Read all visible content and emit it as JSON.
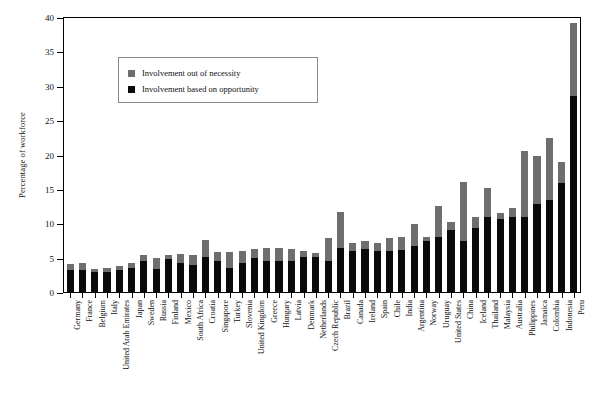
{
  "chart_data": {
    "type": "bar",
    "stacked": true,
    "title": "",
    "xlabel": "",
    "ylabel": "Percentage of workforce",
    "ylim": [
      0,
      40
    ],
    "yticks": [
      0,
      5,
      10,
      15,
      20,
      25,
      30,
      35,
      40
    ],
    "grid": false,
    "legend_position": "upper-left-inside",
    "colors": {
      "necessity": "#6e6e6e",
      "opportunity": "#0a0a0a"
    },
    "categories": [
      "Germany",
      "France",
      "Belgium",
      "Italy",
      "United Arab Emirates",
      "Japan",
      "Sweden",
      "Russia",
      "Finland",
      "Mexico",
      "South Africa",
      "Croatia",
      "Singapore",
      "Turkey",
      "Slovenia",
      "United Kingdom",
      "Greece",
      "Hungary",
      "Latvia",
      "Denmark",
      "Netherlands",
      "Czech Republic",
      "Brazil",
      "Canada",
      "Ireland",
      "Spain",
      "Chile",
      "India",
      "Argentina",
      "Norway",
      "Uruguay",
      "United States",
      "China",
      "Iceland",
      "Thailand",
      "Malaysia",
      "Australia",
      "Philippines",
      "Jamaica",
      "Colombia",
      "Indonesia",
      "Peru"
    ],
    "series": [
      {
        "name": "Involvement based on opportunity",
        "key": "opportunity",
        "values": [
          3.3,
          3.4,
          3.0,
          3.1,
          3.3,
          3.6,
          4.6,
          3.5,
          4.9,
          4.4,
          4.1,
          5.3,
          4.6,
          3.7,
          4.3,
          5.1,
          4.7,
          4.6,
          4.6,
          5.3,
          5.2,
          4.6,
          6.5,
          6.1,
          6.4,
          6.1,
          6.1,
          6.2,
          6.9,
          7.5,
          8.2,
          9.2,
          7.6,
          9.5,
          11.0,
          10.8,
          11.1,
          11.0,
          13.0,
          13.5,
          16.0,
          28.7
        ]
      },
      {
        "name": "Involvement out of necessity",
        "key": "necessity",
        "values": [
          0.9,
          0.9,
          0.5,
          0.5,
          0.6,
          0.7,
          0.9,
          1.6,
          0.6,
          1.3,
          1.5,
          2.4,
          1.4,
          2.3,
          1.8,
          1.3,
          1.9,
          2.0,
          1.8,
          0.8,
          0.6,
          3.4,
          5.3,
          1.2,
          1.1,
          1.2,
          1.9,
          2.0,
          3.1,
          0.6,
          4.5,
          1.2,
          8.6,
          1.6,
          4.3,
          0.9,
          1.3,
          9.6,
          7.0,
          9.0,
          3.0,
          10.6
        ]
      }
    ],
    "totals": [
      4.2,
      4.3,
      3.5,
      3.6,
      3.9,
      4.3,
      5.5,
      5.1,
      5.5,
      5.7,
      5.6,
      7.7,
      6.0,
      6.0,
      6.1,
      6.4,
      6.6,
      6.6,
      6.4,
      6.1,
      5.8,
      8.0,
      11.8,
      7.3,
      7.5,
      7.3,
      8.0,
      8.2,
      10.0,
      8.1,
      12.7,
      10.4,
      16.2,
      11.1,
      15.3,
      11.7,
      12.4,
      20.6,
      20.0,
      22.5,
      19.0,
      39.3
    ]
  },
  "legend": {
    "items": [
      {
        "label": "Involvement out of necessity",
        "swatch": "gray"
      },
      {
        "label": "Involvement based on opportunity",
        "swatch": "black"
      }
    ]
  },
  "axis": {
    "y_title": "Percentage of workforce"
  }
}
